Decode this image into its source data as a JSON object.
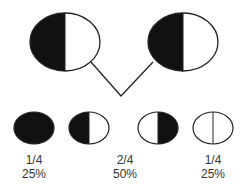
{
  "diagram": {
    "type": "genetic-cross",
    "parents": [
      {
        "id": "parent-1",
        "genotype": "heterozygous",
        "left": "black",
        "right": "white"
      },
      {
        "id": "parent-2",
        "genotype": "heterozygous",
        "left": "black",
        "right": "white"
      }
    ],
    "offspring": [
      {
        "id": "offspring-1",
        "left": "black",
        "right": "black"
      },
      {
        "id": "offspring-2",
        "left": "black",
        "right": "white"
      },
      {
        "id": "offspring-3",
        "left": "white",
        "right": "black"
      },
      {
        "id": "offspring-4",
        "left": "white",
        "right": "white"
      }
    ],
    "labels": [
      {
        "fraction": "1/4",
        "percent": "25%"
      },
      {
        "fraction": "2/4",
        "percent": "50%"
      },
      {
        "fraction": "1/4",
        "percent": "25%"
      }
    ],
    "colors": {
      "fill_dark": "#111111",
      "fill_light": "#ffffff",
      "stroke": "#222222"
    }
  }
}
